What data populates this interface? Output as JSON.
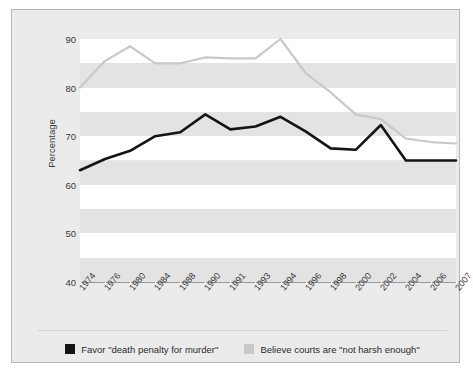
{
  "chart_data": {
    "type": "line",
    "title": "",
    "xlabel": "",
    "ylabel": "Percentage",
    "ylim": [
      40,
      90
    ],
    "yticks": [
      90,
      80,
      70,
      60,
      50,
      40
    ],
    "grid": false,
    "banded_background": true,
    "legend_position": "bottom",
    "categories": [
      "1974",
      "1976",
      "1980",
      "1984",
      "1988",
      "1990",
      "1991",
      "1993",
      "1994",
      "1996",
      "1998",
      "2000",
      "2002",
      "2004",
      "2006",
      "2007"
    ],
    "series": [
      {
        "name": "Favor \"death penalty for murder\"",
        "color": "#141414",
        "values": [
          63.0,
          65.3,
          67.0,
          70.0,
          70.8,
          74.5,
          71.4,
          72.0,
          74.0,
          71.0,
          67.5,
          67.2,
          72.3,
          65.0,
          65.0,
          65.0
        ]
      },
      {
        "name": "Believe courts are \"not harsh enough\"",
        "color": "#c9c9c9",
        "values": [
          80.0,
          85.5,
          88.5,
          85.0,
          85.0,
          86.2,
          86.0,
          86.0,
          90.0,
          83.0,
          79.0,
          74.5,
          73.5,
          69.5,
          68.8,
          68.5
        ]
      }
    ]
  },
  "legend": {
    "items": [
      {
        "label": "Favor \"death penalty for murder\"",
        "color": "#141414",
        "swatch": "legend-swatch-black"
      },
      {
        "label": "Believe courts are \"not harsh enough\"",
        "color": "#c9c9c9",
        "swatch": "legend-swatch-gray"
      }
    ]
  },
  "colors": {
    "figure_background": "#ebebeb",
    "figure_border": "#b7b7b7",
    "plot_band_light": "#ffffff",
    "plot_band_dark": "#e3e3e3",
    "axis": "#9a9a9a",
    "text": "#3a3a3a",
    "series_black": "#141414",
    "series_gray": "#c9c9c9"
  }
}
